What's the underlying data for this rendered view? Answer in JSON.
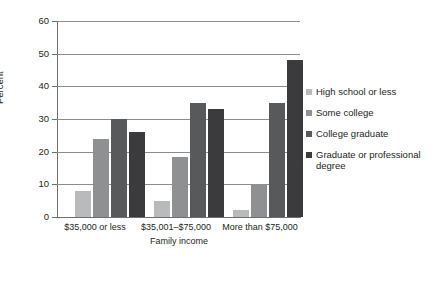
{
  "chart_data": {
    "type": "bar",
    "title": "",
    "xlabel": "Family income",
    "ylabel": "Percent",
    "ylim": [
      0,
      60
    ],
    "yticks": [
      0,
      10,
      20,
      30,
      40,
      50,
      60
    ],
    "grid": true,
    "legend_position": "right",
    "categories": [
      "$35,000 or less",
      "$35,001–$75,000",
      "More than $75,000"
    ],
    "series": [
      {
        "name": "High school or less",
        "color": "#b9babc",
        "values": [
          8,
          5,
          2
        ]
      },
      {
        "name": "Some college",
        "color": "#8e9092",
        "values": [
          24,
          18.5,
          10
        ]
      },
      {
        "name": "College graduate",
        "color": "#58595b",
        "values": [
          30,
          35,
          35
        ]
      },
      {
        "name": "Graduate or professional degree",
        "color": "#3b3b3d",
        "values": [
          26,
          33,
          48
        ]
      }
    ]
  },
  "axis": {
    "y_title": "Percent",
    "x_title": "Family income",
    "y_tick_labels": [
      "0",
      "10",
      "20",
      "30",
      "40",
      "50",
      "60"
    ],
    "x_tick_labels": [
      "$35,000 or less",
      "$35,001–$75,000",
      "More than $75,000"
    ]
  },
  "legend": {
    "items": [
      {
        "label": "High school or less",
        "color": "#b9babc"
      },
      {
        "label": "Some college",
        "color": "#8e9092"
      },
      {
        "label": "College graduate",
        "color": "#58595b"
      },
      {
        "label": "Graduate or professional degree",
        "color": "#3b3b3d"
      }
    ]
  },
  "colors": {
    "axis": "#6d6e71",
    "grid": "#8a8c8e",
    "text": "#231f20",
    "background": "#ffffff"
  }
}
